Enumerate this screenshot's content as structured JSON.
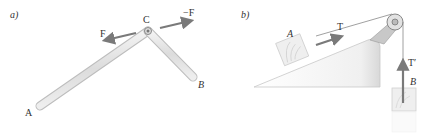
{
  "figure_a": {
    "panel_label": "a)",
    "point_a": "A",
    "point_b": "B",
    "point_c": "C",
    "force_left": "F",
    "force_right": "−F"
  },
  "figure_b": {
    "panel_label": "b)",
    "block_a": "A",
    "block_b": "B",
    "tension_a": "T",
    "tension_b": "T′"
  },
  "colors": {
    "arrow": "#7a7a7a",
    "rod_fill": "#e6e6e6",
    "rod_edge": "#bdbdbd",
    "slope_fill": "#f2f2f2",
    "block_fill": "#efefef"
  }
}
